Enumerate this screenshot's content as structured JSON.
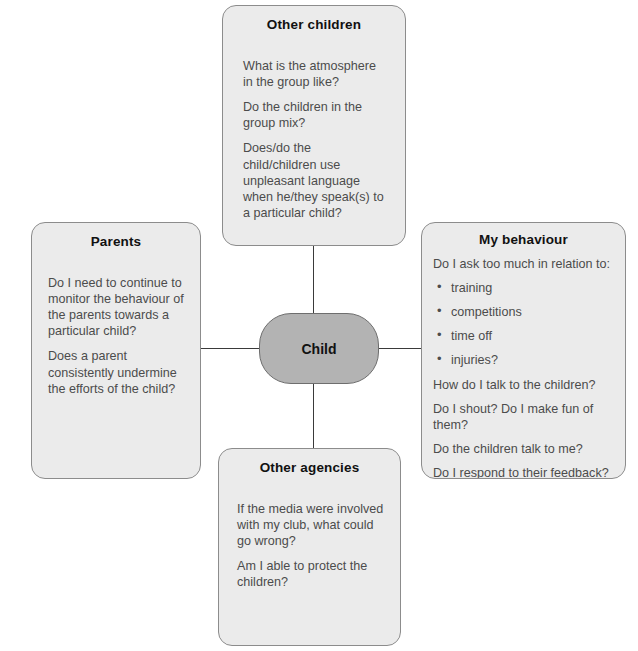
{
  "diagram": {
    "center": {
      "label": "Child"
    },
    "nodes": [
      {
        "id": "other-children",
        "title": "Other children",
        "paragraphs": [
          "What is the atmosphere in the group like?",
          "Do the children in the group mix?",
          "Does/do the child/children use unpleasant language when he/they speak(s) to a particular child?"
        ]
      },
      {
        "id": "parents",
        "title": "Parents",
        "paragraphs": [
          "Do I need to continue to monitor the behaviour of the parents towards a particular child?",
          "Does a parent consistently undermine the efforts of the child?"
        ]
      },
      {
        "id": "my-behaviour",
        "title": "My behaviour",
        "intro": "Do I ask too much in relation to:",
        "bullets": [
          "training",
          "competitions",
          "time off",
          "injuries?"
        ],
        "paragraphs": [
          "How do I talk to the children?",
          "Do I shout? Do I make fun of them?",
          "Do the children talk to me?",
          "Do I respond to their feedback?"
        ]
      },
      {
        "id": "other-agencies",
        "title": "Other agencies",
        "paragraphs": [
          "If the media were involved with my club, what could go wrong?",
          "Am I able to protect the children?"
        ]
      }
    ],
    "colors": {
      "node_fill": "#ebebeb",
      "node_border": "#8c8c8c",
      "center_fill": "#b3b3b3",
      "center_border": "#6e6e6e",
      "connector": "#3a3a3a",
      "title_text": "#111111",
      "body_text": "#4c4c4c",
      "background": "#ffffff"
    }
  }
}
